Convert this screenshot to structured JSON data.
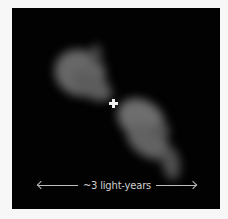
{
  "image": {
    "subject": "bipolar nebula outflow",
    "background_color": "#020202",
    "nebula_color": "#6a6a6a",
    "marker": "cross-marker",
    "scale_bar": {
      "label": "~3 light-years",
      "arrow_left": "left-arrow",
      "arrow_right": "right-arrow"
    }
  }
}
